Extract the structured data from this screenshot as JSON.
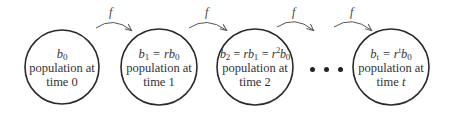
{
  "diagram": {
    "arrow_label": "f",
    "nodes": [
      {
        "id": "time-0",
        "eq_html": "b<sub>0</sub>",
        "line1": "population at",
        "line2": "time 0"
      },
      {
        "id": "time-1",
        "eq_html": "b<sub>1</sub> = rb<sub>0</sub>",
        "line1": "population at",
        "line2": "time 1"
      },
      {
        "id": "time-2",
        "eq_html": "b<sub>2</sub> = rb<sub>1</sub> = r<sup>2</sup>b<sub>0</sub>",
        "line1": "population at",
        "line2": "time 2"
      },
      {
        "id": "time-t",
        "eq_html": "b<sub>t</sub> = r<sup>t</sup>b<sub>0</sub>",
        "line1": "population at",
        "line2_prefix": "time ",
        "line2_var": "t"
      }
    ],
    "ellipsis": "• • •",
    "colors": {
      "stroke": "#2a2a2a",
      "arrow": "#555555",
      "text": "#333333"
    }
  }
}
